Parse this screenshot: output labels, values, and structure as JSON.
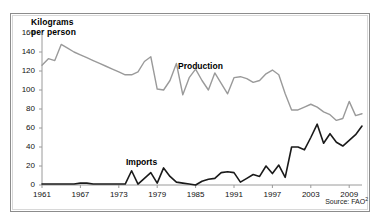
{
  "chart_data": {
    "type": "line",
    "title": "",
    "ylabel": "Kilograms\nper person",
    "ylabel_line1": "Kilograms",
    "ylabel_line2": "per person",
    "xlabel": "",
    "ylim": [
      0,
      160
    ],
    "yticks": [
      0,
      20,
      40,
      60,
      80,
      100,
      120,
      140,
      160
    ],
    "xlim": [
      1961,
      2011
    ],
    "xticks": [
      1961,
      1967,
      1973,
      1979,
      1985,
      1991,
      1997,
      2003,
      2009
    ],
    "xtick_labels": [
      "1961",
      "1967",
      "1973",
      "1979",
      "1985",
      "1991",
      "1997",
      "2003",
      "2009"
    ],
    "grid": false,
    "legend_position": "inline-annotation",
    "x": [
      1961,
      1962,
      1963,
      1964,
      1965,
      1966,
      1967,
      1968,
      1969,
      1970,
      1971,
      1972,
      1973,
      1974,
      1975,
      1976,
      1977,
      1978,
      1979,
      1980,
      1981,
      1982,
      1983,
      1984,
      1985,
      1986,
      1987,
      1988,
      1989,
      1990,
      1991,
      1992,
      1993,
      1994,
      1995,
      1996,
      1997,
      1998,
      1999,
      2000,
      2001,
      2002,
      2003,
      2004,
      2005,
      2006,
      2007,
      2008,
      2009,
      2010,
      2011
    ],
    "series": [
      {
        "name": "Production",
        "color": "#9a9a9a",
        "values": [
          126,
          133,
          131,
          148,
          144,
          140,
          137,
          134,
          131,
          128,
          125,
          122,
          119,
          116,
          116,
          119,
          130,
          135,
          101,
          100,
          110,
          128,
          95,
          113,
          122,
          110,
          100,
          118,
          107,
          96,
          113,
          114,
          112,
          108,
          110,
          117,
          121,
          116,
          96,
          79,
          79,
          82,
          85,
          82,
          77,
          74,
          68,
          70,
          88,
          73,
          75
        ]
      },
      {
        "name": "Imports",
        "color": "#1a1a1a",
        "values": [
          1,
          1,
          1,
          1,
          1,
          1,
          2,
          2,
          1,
          1,
          1,
          1,
          1,
          1,
          15,
          1,
          7,
          13,
          2,
          18,
          9,
          3,
          2,
          1,
          0,
          4,
          6,
          7,
          13,
          14,
          13,
          3,
          7,
          11,
          9,
          20,
          12,
          21,
          8,
          40,
          40,
          37,
          50,
          64,
          44,
          54,
          45,
          41,
          47,
          53,
          62
        ]
      }
    ],
    "annotations": [
      {
        "text": "Production",
        "series": "Production"
      },
      {
        "text": "Imports",
        "series": "Imports"
      }
    ],
    "source_prefix": "Source: FAO",
    "source_superscript": "2"
  }
}
